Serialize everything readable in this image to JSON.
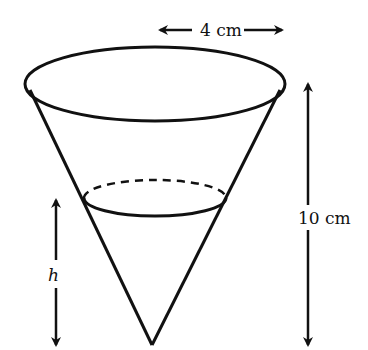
{
  "diagram": {
    "type": "cone-with-water",
    "labels": {
      "radius": "4 cm",
      "height": "10 cm",
      "water_depth": "h"
    },
    "colors": {
      "stroke": "#111111",
      "background": "#ffffff"
    }
  }
}
